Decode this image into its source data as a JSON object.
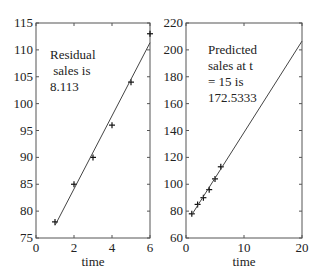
{
  "chart_data": [
    {
      "type": "scatter",
      "title": "",
      "xlabel": "time",
      "ylabel": "",
      "xlim": [
        0,
        6
      ],
      "ylim": [
        75,
        115
      ],
      "xticks": [
        0,
        2,
        4,
        6
      ],
      "yticks": [
        75,
        80,
        85,
        90,
        95,
        100,
        105,
        110,
        115
      ],
      "grid": false,
      "series": [
        {
          "name": "sales",
          "marker": "+",
          "x": [
            1,
            2,
            3,
            4,
            5,
            6
          ],
          "y": [
            78,
            85,
            90,
            96,
            104,
            113
          ]
        },
        {
          "name": "fit",
          "style": "line",
          "x": [
            1,
            6
          ],
          "y": [
            77.333,
            111.333
          ]
        }
      ],
      "annotation": [
        "Residual",
        " sales is",
        "8.113"
      ]
    },
    {
      "type": "scatter",
      "title": "",
      "xlabel": "time",
      "ylabel": "",
      "xlim": [
        0,
        20
      ],
      "ylim": [
        60,
        220
      ],
      "xticks": [
        0,
        10,
        20
      ],
      "yticks": [
        60,
        80,
        100,
        120,
        140,
        160,
        180,
        200,
        220
      ],
      "grid": false,
      "series": [
        {
          "name": "sales",
          "marker": "+",
          "x": [
            1,
            2,
            3,
            4,
            5,
            6
          ],
          "y": [
            78,
            85,
            90,
            96,
            104,
            113
          ]
        },
        {
          "name": "fit",
          "style": "line",
          "x": [
            1,
            20
          ],
          "y": [
            77.333,
            206.533
          ]
        }
      ],
      "annotation": [
        "Predicted",
        "sales at t",
        "= 15 is",
        "172.5333"
      ]
    }
  ],
  "colors": {
    "axis": "#555555",
    "line": "#444444",
    "marker": "#111111",
    "text": "#222222"
  }
}
